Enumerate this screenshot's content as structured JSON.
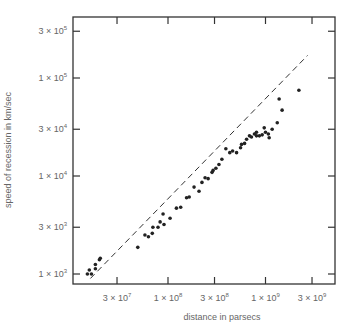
{
  "chart_data": {
    "type": "scatter",
    "title": "",
    "xlabel": "distance in parsecs",
    "ylabel": "speed of recession in km/sec",
    "xscale": "log",
    "yscale": "log",
    "xlim": [
      14000000,
      4000000000
    ],
    "ylim": [
      900,
      400000
    ],
    "xticks": [
      {
        "value": 30000000,
        "label": "3 × 10⁷"
      },
      {
        "value": 100000000,
        "label": "1 × 10⁸"
      },
      {
        "value": 300000000,
        "label": "3 × 10⁸"
      },
      {
        "value": 1000000000,
        "label": "1 × 10⁹"
      },
      {
        "value": 3000000000,
        "label": "3 × 10⁹"
      }
    ],
    "yticks": [
      {
        "value": 1000,
        "label": "1 × 10³"
      },
      {
        "value": 3000,
        "label": "3 × 10³"
      },
      {
        "value": 10000,
        "label": "1 × 10⁴"
      },
      {
        "value": 30000,
        "label": "3 × 10⁴"
      },
      {
        "value": 100000,
        "label": "1 × 10⁵"
      },
      {
        "value": 300000,
        "label": "3 × 10⁵"
      }
    ],
    "grid": false,
    "legend": null,
    "fit_line": {
      "style": "dashed",
      "from": [
        16000000,
        900
      ],
      "to": [
        2700000000,
        170000
      ]
    },
    "points": [
      [
        14900000,
        1000
      ],
      [
        16400000,
        1000
      ],
      [
        15600000,
        1100
      ],
      [
        18000000,
        1130
      ],
      [
        18000000,
        1250
      ],
      [
        19800000,
        1400
      ],
      [
        20200000,
        1450
      ],
      [
        49000000,
        1870
      ],
      [
        58000000,
        2500
      ],
      [
        63000000,
        2400
      ],
      [
        69000000,
        2600
      ],
      [
        70000000,
        3000
      ],
      [
        79000000,
        3000
      ],
      [
        83000000,
        3400
      ],
      [
        91000000,
        3200
      ],
      [
        89000000,
        4100
      ],
      [
        105000000,
        3700
      ],
      [
        122000000,
        4700
      ],
      [
        135000000,
        4800
      ],
      [
        155000000,
        6000
      ],
      [
        165000000,
        6100
      ],
      [
        185000000,
        7700
      ],
      [
        208000000,
        7000
      ],
      [
        223000000,
        8600
      ],
      [
        240000000,
        9600
      ],
      [
        258000000,
        9400
      ],
      [
        283000000,
        10900
      ],
      [
        290000000,
        11400
      ],
      [
        310000000,
        12000
      ],
      [
        333000000,
        13100
      ],
      [
        357000000,
        14800
      ],
      [
        392000000,
        19000
      ],
      [
        430000000,
        17300
      ],
      [
        460000000,
        18000
      ],
      [
        505000000,
        17300
      ],
      [
        555000000,
        19400
      ],
      [
        568000000,
        21000
      ],
      [
        610000000,
        21500
      ],
      [
        640000000,
        23700
      ],
      [
        685000000,
        25700
      ],
      [
        718000000,
        25000
      ],
      [
        770000000,
        26800
      ],
      [
        808000000,
        25700
      ],
      [
        865000000,
        25700
      ],
      [
        925000000,
        26300
      ],
      [
        808000000,
        28000
      ],
      [
        970000000,
        31000
      ],
      [
        1090000000,
        24600
      ],
      [
        1000000000,
        28000
      ],
      [
        1170000000,
        30000
      ],
      [
        1070000000,
        26800
      ],
      [
        1320000000,
        35000
      ],
      [
        1380000000,
        61000
      ],
      [
        1480000000,
        47000
      ],
      [
        2200000000,
        75000
      ]
    ]
  }
}
